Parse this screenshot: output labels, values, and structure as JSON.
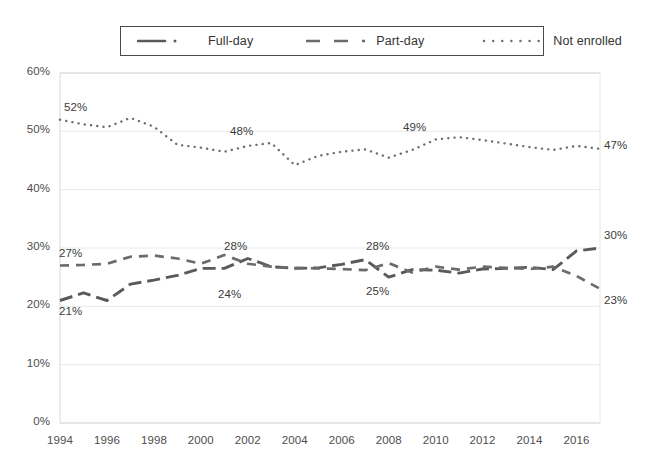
{
  "chart_data": {
    "type": "line",
    "title": "",
    "subtitle": "",
    "xlabel": "",
    "ylabel": "",
    "xlim": [
      1994,
      2017
    ],
    "ylim": [
      0,
      60
    ],
    "grid": true,
    "legend_position": "top",
    "y_ticks": [
      "0%",
      "10%",
      "20%",
      "30%",
      "40%",
      "50%",
      "60%"
    ],
    "y_tick_values": [
      0,
      10,
      20,
      30,
      40,
      50,
      60
    ],
    "x_ticks": [
      "1994",
      "1996",
      "1998",
      "2000",
      "2002",
      "2004",
      "2006",
      "2008",
      "2010",
      "2012",
      "2014",
      "2016"
    ],
    "x_tick_values": [
      1994,
      1996,
      1998,
      2000,
      2002,
      2004,
      2006,
      2008,
      2010,
      2012,
      2014,
      2016
    ],
    "x": [
      1994,
      1995,
      1996,
      1997,
      1998,
      1999,
      2000,
      2001,
      2002,
      2003,
      2004,
      2005,
      2006,
      2007,
      2008,
      2009,
      2010,
      2011,
      2012,
      2013,
      2014,
      2015,
      2016,
      2017
    ],
    "series": [
      {
        "name": "Full-day",
        "style": "dashdot",
        "color": "#5a5a5a",
        "values": [
          21,
          22.3,
          21,
          23.8,
          24.5,
          25.3,
          26.5,
          26.5,
          28.2,
          26.8,
          26.5,
          26.6,
          27.2,
          28,
          25,
          26.3,
          26.2,
          25.7,
          26.4,
          26.5,
          26.7,
          26.3,
          29.5,
          30
        ]
      },
      {
        "name": "Part-day",
        "style": "dashed",
        "color": "#6b6b6b",
        "values": [
          27,
          27.1,
          27.3,
          28.5,
          28.7,
          28.2,
          27.3,
          28.8,
          27.3,
          26.8,
          26.6,
          26.5,
          26.4,
          26.2,
          27.4,
          25.8,
          26.8,
          26.3,
          26.8,
          26.6,
          26.4,
          26.8,
          25.2,
          23
        ]
      },
      {
        "name": "Not enrolled",
        "style": "dotted",
        "color": "#6e6e6e",
        "values": [
          52,
          51.2,
          50.7,
          52.3,
          50.8,
          47.7,
          47.2,
          46.5,
          47.5,
          48,
          44.2,
          45.8,
          46.5,
          46.9,
          45.5,
          46.8,
          48.6,
          49,
          48.5,
          47.9,
          47.3,
          46.8,
          47.5,
          47
        ]
      }
    ],
    "data_labels": [
      {
        "series": "Not enrolled",
        "text": "52%",
        "x": 1994,
        "y": 52,
        "anchor_x": 64,
        "anchor_y": 101
      },
      {
        "series": "Not enrolled",
        "text": "48%",
        "x": 2003,
        "y": 48,
        "anchor_x": 230,
        "anchor_y": 125
      },
      {
        "series": "Not enrolled",
        "text": "49%",
        "x": 2011,
        "y": 49,
        "anchor_x": 403,
        "anchor_y": 121
      },
      {
        "series": "Not enrolled",
        "text": "47%",
        "x": 2017,
        "y": 47,
        "anchor_x": 604,
        "anchor_y": 139
      },
      {
        "series": "Part-day",
        "text": "27%",
        "x": 1994,
        "y": 27,
        "anchor_x": 59,
        "anchor_y": 247
      },
      {
        "series": "Part-day",
        "text": "28%",
        "x": 2001,
        "y": 28.8,
        "anchor_x": 224,
        "anchor_y": 240
      },
      {
        "series": "Part-day",
        "text": "28%",
        "x": 2008,
        "y": 27.4,
        "anchor_x": 366,
        "anchor_y": 240
      },
      {
        "series": "Part-day",
        "text": "23%",
        "x": 2017,
        "y": 23,
        "anchor_x": 604,
        "anchor_y": 294
      },
      {
        "series": "Full-day",
        "text": "21%",
        "x": 1994,
        "y": 21,
        "anchor_x": 59,
        "anchor_y": 305
      },
      {
        "series": "Full-day",
        "text": "24%",
        "x": 2004,
        "y": 26.5,
        "anchor_x": 218,
        "anchor_y": 288
      },
      {
        "series": "Full-day",
        "text": "25%",
        "x": 2008,
        "y": 25,
        "anchor_x": 366,
        "anchor_y": 285
      },
      {
        "series": "Full-day",
        "text": "30%",
        "x": 2017,
        "y": 30,
        "anchor_x": 604,
        "anchor_y": 229
      }
    ]
  },
  "legend": {
    "items": [
      {
        "label": "Full-day",
        "pattern": "dashdot"
      },
      {
        "label": "Part-day",
        "pattern": "dashed"
      },
      {
        "label": "Not enrolled",
        "pattern": "dotted"
      }
    ]
  },
  "colors": {
    "grid": "#e8e8e8",
    "axis_text": "#4d4d4d",
    "series_1": "#5a5a5a",
    "series_2": "#6b6b6b",
    "series_3": "#6e6e6e",
    "legend_border": "#4a4a4a",
    "background": "#ffffff"
  }
}
